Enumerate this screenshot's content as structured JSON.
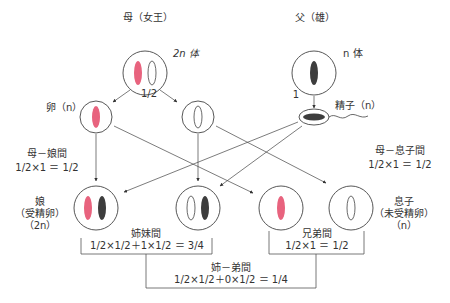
{
  "colors": {
    "maternal_chromosome": "#e8637e",
    "paternal_chromosome": "#3d3d3d",
    "line": "#444444",
    "background": "#ffffff"
  },
  "parents": {
    "mother": {
      "label": "母（女王）",
      "ploidy": "2n 体"
    },
    "father": {
      "label": "父（雄）",
      "ploidy": "n 体"
    }
  },
  "gametes": {
    "egg": {
      "label": "卵（n）",
      "probability": "1/2"
    },
    "sperm": {
      "label": "精子（n）",
      "probability": "1"
    }
  },
  "offspring": {
    "daughter": {
      "label_line1": "娘",
      "label_line2": "（受精卵）",
      "label_line3": "（2n）"
    },
    "son": {
      "label_line1": "息子",
      "label_line2": "（未受精卵）",
      "label_line3": "（n）"
    }
  },
  "relatedness": {
    "mother_daughter": {
      "title": "母－娘間",
      "formula": "1/2×1 ＝ 1/2"
    },
    "mother_son": {
      "title": "母－息子間",
      "formula": "1/2×1 ＝ 1/2"
    },
    "sisters": {
      "title": "姉妹間",
      "formula": "1/2×1/2＋1×1/2 ＝ 3/4"
    },
    "brothers": {
      "title": "兄弟間",
      "formula": "1/2×1 ＝ 1/2"
    },
    "sister_brother": {
      "title": "姉－弟間",
      "formula": "1/2×1/2＋0×1/2 ＝ 1/4"
    }
  }
}
